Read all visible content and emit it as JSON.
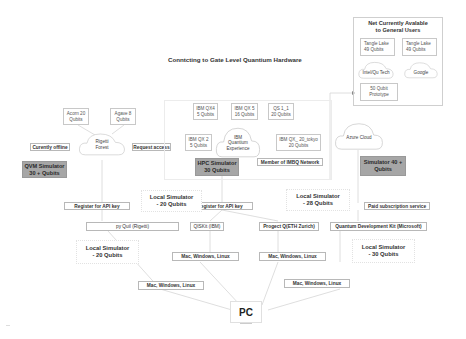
{
  "title": "Conntcting to Gate Level Quantium Hardware",
  "not_available": {
    "heading_line1": "Net Currently Avalable",
    "heading_line2": "to General Users",
    "items": [
      {
        "line1": "Tangle Lake",
        "line2": "49 Qubits"
      },
      {
        "line1": "Tangle Lake",
        "line2": "49 Qubits"
      }
    ],
    "clouds": [
      "Intel/Qu Tech",
      "Google"
    ],
    "prototype": {
      "line1": "50 Qubit",
      "line2": "Prototype"
    }
  },
  "rigetti": {
    "cloud_line1": "Rigetti",
    "cloud_line2": "Forest",
    "devices": [
      {
        "line1": "Acorn 20",
        "line2": "Qubits"
      },
      {
        "line1": "Agave 8",
        "line2": "Qubits"
      }
    ],
    "status": "Curently offline",
    "access": "Request access",
    "simulator_line1": "QVM Simulator",
    "simulator_line2": "30 + Qubits",
    "register": "Register for API key",
    "sdk": "py Quil (Rigetti)",
    "local_line1": "Local Simulator",
    "local_line2": "- 20 Qubits",
    "os": "Mac, Windows, Linux"
  },
  "ibm": {
    "cloud_line1": "IBM",
    "cloud_line2": "Quantium",
    "cloud_line3": "Experience",
    "devices": [
      {
        "line1": "IBM QX4",
        "line2": "5  Qubits"
      },
      {
        "line1": "IBM QX 5",
        "line2": "16 Qubits"
      },
      {
        "line1": "QS 1_1",
        "line2": "20 Qubits"
      },
      {
        "line1": "IBM QX 2",
        "line2": "5  Qubits"
      },
      {
        "line1": "IBM QX_ 20_tokyo",
        "line2": "20 Qubits"
      }
    ],
    "simulator_line1": "HPC Simulator",
    "simulator_line2": "30 Qubits",
    "network": "Member of IMBQ Network",
    "register": "Register for API key",
    "local_line1": "Local Simulator",
    "local_line2": "- 20 Qubits",
    "sdk": "QISKit (IBM)",
    "os": "Mac, Windows, Linux"
  },
  "eth": {
    "local_line1": "Local Simulator",
    "local_line2": "- 28 Qubits",
    "sdk": "Progect Q(ETH Zurich)",
    "os": "Mac, Windows, Linux"
  },
  "microsoft": {
    "cloud": "Azure Cloud",
    "simulator_line1": "Simulator 40 +",
    "simulator_line2": "Qubits",
    "paid": "Paid subscription service",
    "sdk": "Quantum Development Kit (Microsoft)",
    "local_line1": "Local Simulator",
    "local_line2": "- 30 Qubits",
    "os": "Mac, Windows, Linux"
  },
  "pc": "PC",
  "colors": {
    "simulator_fill": "#a6a6a6",
    "border": "#c8c8c8",
    "line": "#d8d8d8"
  }
}
